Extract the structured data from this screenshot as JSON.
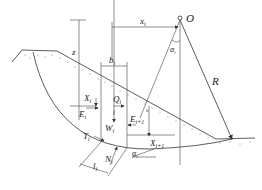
{
  "diagram": {
    "center_label": "O",
    "radius_label": "R",
    "labels": {
      "x_i": "x",
      "x_i_sub": "i",
      "alpha_top": "α",
      "alpha_top_sub": "i",
      "z": "z",
      "b_i": "b",
      "b_i_sub": "i",
      "X_i": "X",
      "X_i_sub": "i",
      "Q_i": "Q",
      "Q_i_sub": "i",
      "E_i": "E",
      "E_i_sub": "i",
      "W_i": "W",
      "W_i_sub": "i",
      "E_i1": "E",
      "E_i1_sub": "i+1",
      "X_i1": "X",
      "X_i1_sub": "i+1",
      "T_i": "T",
      "T_i_sub": "i",
      "N_i": "N",
      "N_i_sub": "i",
      "l_i": "l",
      "l_i_sub": "i",
      "alpha_bottom": "α",
      "alpha_bottom_sub": "i",
      "h_small": "h"
    },
    "colors": {
      "line": "#333333",
      "background": "#ffffff"
    }
  }
}
